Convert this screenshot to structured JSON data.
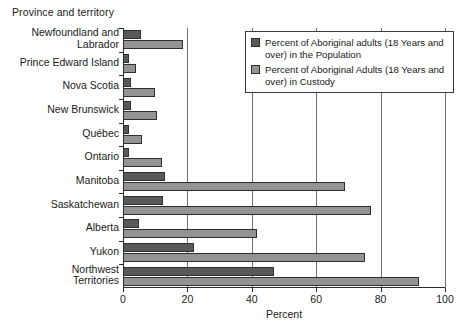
{
  "category_axis_title": "Province and territory",
  "legend": {
    "items": [
      {
        "key": "population",
        "label": "Percent of Aboriginal adults (18 Years and over) in the Population",
        "color": "#595959"
      },
      {
        "key": "custody",
        "label": "Percent of Aboriginal Adults (18 Years and over) in Custody",
        "color": "#939393"
      }
    ]
  },
  "chart_data": {
    "type": "bar",
    "orientation": "horizontal",
    "title": "",
    "xlabel": "Percent",
    "ylabel": "Province and territory",
    "xlim": [
      0,
      100
    ],
    "xticks": [
      0,
      20,
      40,
      60,
      80,
      100
    ],
    "xtick_labels": [
      "0",
      "20",
      "40",
      "60",
      "80",
      "100"
    ],
    "grid": true,
    "legend_position": "top-right",
    "categories": [
      "Newfoundland and\nLabrador",
      "Prince Edward Island",
      "Nova Scotia",
      "New Brunswick",
      "Québec",
      "Ontario",
      "Manitoba",
      "Saskatchewan",
      "Alberta",
      "Yukon",
      "Northwest\nTerritories"
    ],
    "series": [
      {
        "name": "Percent of Aboriginal adults (18 Years and over) in the Population",
        "color": "#595959",
        "values": [
          5.5,
          2,
          2.5,
          2.5,
          2,
          2,
          13,
          12.5,
          5,
          22,
          47
        ]
      },
      {
        "name": "Percent of Aboriginal Adults (18 Years and over) in Custody",
        "color": "#939393",
        "values": [
          18.5,
          4,
          10,
          10.5,
          6,
          12,
          69,
          77,
          41.5,
          75,
          92
        ]
      }
    ]
  }
}
